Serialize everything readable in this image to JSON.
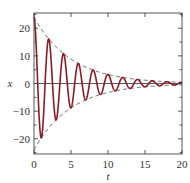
{
  "chart_data": {
    "type": "line",
    "title": "",
    "xlabel": "t",
    "ylabel": "x",
    "xlim": [
      0,
      20
    ],
    "ylim": [
      -25.5,
      25.5
    ],
    "xticks": [
      0,
      5,
      10,
      15,
      20
    ],
    "yticks": [
      -20,
      -10,
      0,
      10,
      20
    ],
    "grid": false,
    "legend": null,
    "zero_line": true,
    "series": [
      {
        "name": "x(t) damped oscillation",
        "style": "solid",
        "color": "#8b1a24",
        "formula": "24*exp(-0.2*t)*cos(pi*t)",
        "peaks": [
          {
            "t": 0,
            "x": 24.0
          },
          {
            "t": 1,
            "x": -19.6
          },
          {
            "t": 2,
            "x": 16.1
          },
          {
            "t": 3,
            "x": -13.2
          },
          {
            "t": 4,
            "x": 10.8
          },
          {
            "t": 5,
            "x": -8.8
          },
          {
            "t": 6,
            "x": 7.2
          },
          {
            "t": 7,
            "x": -5.9
          },
          {
            "t": 8,
            "x": 4.8
          },
          {
            "t": 9,
            "x": -4.0
          },
          {
            "t": 10,
            "x": 3.2
          },
          {
            "t": 12,
            "x": 2.2
          },
          {
            "t": 14,
            "x": 1.5
          },
          {
            "t": 16,
            "x": 1.0
          },
          {
            "t": 18,
            "x": 0.7
          },
          {
            "t": 20,
            "x": 0.4
          }
        ]
      },
      {
        "name": "upper envelope",
        "style": "dashed",
        "color": "#555555",
        "formula": "24*exp(-0.2*t)"
      },
      {
        "name": "lower envelope",
        "style": "dashed",
        "color": "#555555",
        "formula": "-24*exp(-0.2*t)"
      }
    ],
    "params": {
      "amplitude": 24,
      "decay": 0.2,
      "omega": 3.14159
    }
  },
  "layout": {
    "plot_left": 34,
    "plot_right": 182,
    "plot_top": 13,
    "plot_bottom": 154
  }
}
